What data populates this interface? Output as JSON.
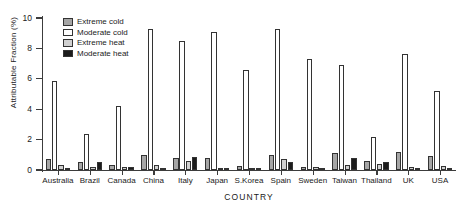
{
  "chart_data": {
    "type": "bar",
    "title": "",
    "xlabel": "COUNTRY",
    "ylabel": "Attributable Fraction (%)",
    "ylim": [
      0,
      10
    ],
    "yticks": [
      0,
      2,
      4,
      6,
      8,
      10
    ],
    "ytick_labels": [
      "0",
      "2",
      "4",
      "6",
      "8",
      "10"
    ],
    "grid": false,
    "legend_position": "top-left",
    "categories": [
      "Australia",
      "Brazil",
      "Canada",
      "China",
      "Italy",
      "Japan",
      "S.Korea",
      "Spain",
      "Sweden",
      "Taiwan",
      "Thailand",
      "UK",
      "USA"
    ],
    "series": [
      {
        "name": "Extreme cold",
        "color": "#a6a6a6",
        "values": [
          0.7,
          0.5,
          0.3,
          1.0,
          0.8,
          0.8,
          0.25,
          1.0,
          0.2,
          1.1,
          0.6,
          1.2,
          0.9
        ]
      },
      {
        "name": "Moderate cold",
        "color": "#ffffff",
        "values": [
          5.85,
          2.35,
          4.2,
          9.3,
          8.5,
          9.1,
          6.6,
          9.3,
          7.3,
          6.9,
          2.15,
          7.6,
          5.2
        ]
      },
      {
        "name": "Extreme heat",
        "color": "#d0d0d0",
        "values": [
          0.3,
          0.2,
          0.2,
          0.35,
          0.6,
          0.15,
          0.12,
          0.7,
          0.18,
          0.35,
          0.4,
          0.2,
          0.25
        ]
      },
      {
        "name": "Moderate heat",
        "color": "#1c1c1c",
        "values": [
          0.15,
          0.5,
          0.2,
          0.15,
          0.85,
          0.1,
          0.1,
          0.55,
          0.08,
          0.8,
          0.5,
          0.1,
          0.12
        ]
      }
    ]
  },
  "legend": {
    "items": [
      {
        "label": "Extreme cold",
        "color": "#a6a6a6"
      },
      {
        "label": "Moderate cold",
        "color": "#ffffff"
      },
      {
        "label": "Extreme heat",
        "color": "#d0d0d0"
      },
      {
        "label": "Moderate heat",
        "color": "#1c1c1c"
      }
    ]
  }
}
